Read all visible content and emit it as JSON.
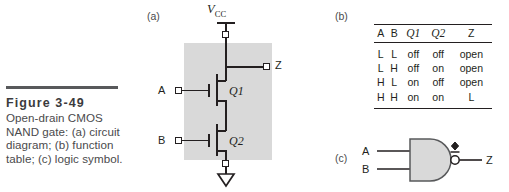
{
  "figure": {
    "number": "Figure 3-49",
    "caption": "Open-drain CMOS NAND gate: (a) circuit diagram; (b) function table; (c) logic symbol."
  },
  "part_labels": {
    "a": "(a)",
    "b": "(b)",
    "c": "(c)"
  },
  "circuit": {
    "supply_label_v": "V",
    "supply_label_sub": "CC",
    "input_a": "A",
    "input_b": "B",
    "output_z": "Z",
    "transistor_top": "Q1",
    "transistor_bottom": "Q2",
    "shade_color": "#d9d9d9",
    "wire_color": "#231f20"
  },
  "function_table": {
    "headers": [
      "A",
      "B",
      "Q1",
      "Q2",
      "Z"
    ],
    "rows": [
      [
        "L",
        "L",
        "off",
        "off",
        "open"
      ],
      [
        "L",
        "H",
        "off",
        "on",
        "open"
      ],
      [
        "H",
        "L",
        "on",
        "off",
        "open"
      ],
      [
        "H",
        "H",
        "on",
        "on",
        "L"
      ]
    ]
  },
  "logic_symbol": {
    "input_a": "A",
    "input_b": "B",
    "output_z": "Z",
    "gate_type": "nand-gate",
    "open_drain_marker": "open-drain-diamond",
    "body_fill": "#d9d9d9"
  }
}
